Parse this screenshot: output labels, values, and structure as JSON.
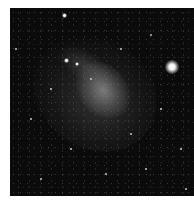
{
  "image": {
    "subject": "dwarf galaxy star field",
    "background_color": "#0b0b0b",
    "border_color": "#ffffff"
  },
  "bright_stars": [
    {
      "x": 162,
      "y": 59,
      "size": 14
    },
    {
      "x": 54,
      "y": 7,
      "size": 5
    },
    {
      "x": 56,
      "y": 52,
      "size": 5
    },
    {
      "x": 67,
      "y": 56,
      "size": 4
    }
  ],
  "faint_stars": [
    {
      "x": 140,
      "y": 26,
      "size": 2
    },
    {
      "x": 20,
      "y": 110,
      "size": 1.5
    },
    {
      "x": 95,
      "y": 165,
      "size": 1.5
    },
    {
      "x": 120,
      "y": 125,
      "size": 1.5
    },
    {
      "x": 30,
      "y": 170,
      "size": 1.5
    },
    {
      "x": 170,
      "y": 140,
      "size": 1.5
    },
    {
      "x": 80,
      "y": 70,
      "size": 2
    },
    {
      "x": 150,
      "y": 100,
      "size": 1.5
    },
    {
      "x": 40,
      "y": 80,
      "size": 1.5
    },
    {
      "x": 110,
      "y": 40,
      "size": 1.5
    },
    {
      "x": 5,
      "y": 40,
      "size": 1.5
    },
    {
      "x": 175,
      "y": 180,
      "size": 1.5
    },
    {
      "x": 60,
      "y": 140,
      "size": 1.5
    },
    {
      "x": 135,
      "y": 160,
      "size": 1.5
    }
  ]
}
